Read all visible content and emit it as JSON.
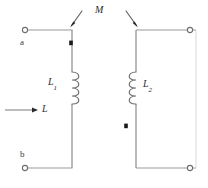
{
  "figure": {
    "background_color": "#ffffff",
    "wire_color": "#8c8c8c",
    "wire_dark_color": "#6e6e6e",
    "faint_wire_color": "#d9d9d9",
    "label_color": "#2b2b2b",
    "marker_color": "#1a1a1a"
  },
  "labels": {
    "terminal_a": "a",
    "terminal_b": "b",
    "inductor_left": "L",
    "inductor_left_sub": "1",
    "inductor_right": "L",
    "inductor_right_sub": "2",
    "mutual_inductance": "M",
    "current": "L"
  },
  "elements": {
    "left_loop": {
      "name": "primary-circuit",
      "top_wire": {
        "x1": 28,
        "y1": 30,
        "x2": 72,
        "y2": 30
      },
      "bottom_wire": {
        "x1": 28,
        "y1": 168,
        "x2": 72,
        "y2": 168
      },
      "vertical_wire_top": {
        "x1": 72,
        "y1": 30,
        "x2": 72,
        "y2": 72
      },
      "vertical_wire_bottom": {
        "x1": 72,
        "y1": 104,
        "x2": 72,
        "y2": 168
      },
      "coil": {
        "x": 72,
        "y_top": 72,
        "y_bottom": 104,
        "turns": 4,
        "bulge": "right"
      }
    },
    "right_loop": {
      "name": "secondary-circuit",
      "top_wire": {
        "x1": 136,
        "y1": 30,
        "x2": 190,
        "y2": 30
      },
      "bottom_wire": {
        "x1": 136,
        "y1": 168,
        "x2": 190,
        "y2": 168
      },
      "vertical_wire_top": {
        "x1": 136,
        "y1": 30,
        "x2": 136,
        "y2": 72
      },
      "vertical_wire_bottom": {
        "x1": 136,
        "y1": 104,
        "x2": 136,
        "y2": 168
      },
      "right_vertical_wire": {
        "x1": 196,
        "y1": 30,
        "x2": 196,
        "y2": 168
      },
      "coil": {
        "x": 136,
        "y_top": 72,
        "y_bottom": 104,
        "turns": 4,
        "bulge": "left"
      }
    },
    "terminals": [
      {
        "name": "terminal-a",
        "cx": 25,
        "cy": 30,
        "r": 2.6
      },
      {
        "name": "terminal-b",
        "cx": 25,
        "cy": 168,
        "r": 2.6
      },
      {
        "name": "terminal-c",
        "cx": 190,
        "cy": 30,
        "r": 2.6
      },
      {
        "name": "terminal-d",
        "cx": 190,
        "cy": 168,
        "r": 2.6
      }
    ],
    "polarity_dots": [
      {
        "name": "dot-primary",
        "x": 71,
        "y": 43
      },
      {
        "name": "dot-secondary",
        "x": 126,
        "y": 126
      }
    ],
    "mutual_arrows": [
      {
        "name": "mutual-arrow-left",
        "x1": 81,
        "y1": 12,
        "x2": 70,
        "y2": 26
      },
      {
        "name": "mutual-arrow-right",
        "x1": 127,
        "y1": 12,
        "x2": 138,
        "y2": 26
      }
    ],
    "current_arrow": {
      "name": "current-arrow",
      "x1": 5,
      "y1": 110,
      "x2": 38,
      "y2": 110
    }
  },
  "label_positions": {
    "terminal_a": {
      "x": 20,
      "y": 38
    },
    "terminal_b": {
      "x": 20,
      "y": 151
    },
    "inductor_left": {
      "x": 49,
      "y": 78
    },
    "inductor_right": {
      "x": 143,
      "y": 80
    },
    "mutual_inductance": {
      "x": 96,
      "y": 6
    },
    "current": {
      "x": 42,
      "y": 105
    }
  }
}
